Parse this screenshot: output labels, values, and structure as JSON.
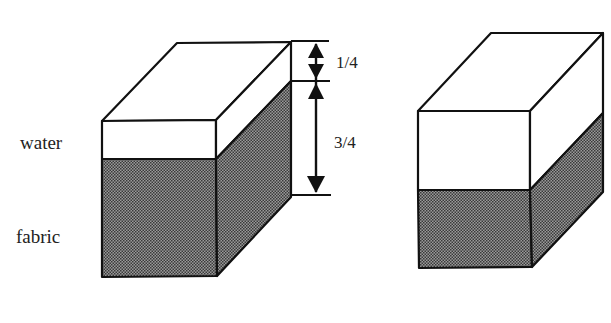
{
  "diagram": {
    "labels": {
      "water": "water",
      "fabric": "fabric"
    },
    "dimensions": {
      "top_fraction": "1/4",
      "bottom_fraction": "3/4"
    },
    "colors": {
      "outline": "#111111",
      "water_fill": "#ffffff",
      "fabric_fill": "#7a7a7a",
      "background": "#ffffff"
    },
    "blocks": [
      {
        "name": "left-block",
        "description": "block with water layer and fabric layer, dimensioned 1/4 and 3/4"
      },
      {
        "name": "right-block",
        "description": "block with thicker water layer and thinner fabric layer"
      }
    ]
  }
}
